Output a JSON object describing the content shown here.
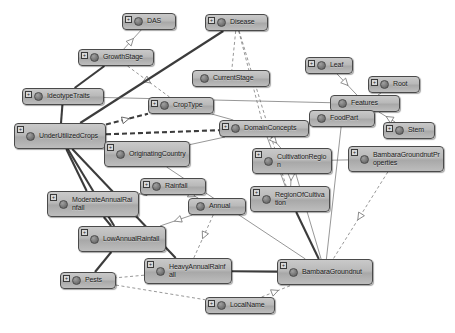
{
  "diagram": {
    "type": "ontology-class-graph",
    "background_color": "#ffffff",
    "node_fill_color": "#b9b9b9",
    "node_border_color": "#4a4a4a",
    "edge_color": "#555555",
    "canvas": {
      "width": 455,
      "height": 333
    }
  },
  "nodes": [
    {
      "id": "das",
      "label": "DAS",
      "x": 122,
      "y": 13,
      "w": 54,
      "h": 17,
      "expandable": true,
      "lines": 1
    },
    {
      "id": "disease",
      "label": "Disease",
      "x": 205,
      "y": 14,
      "w": 63,
      "h": 17,
      "expandable": true,
      "lines": 1
    },
    {
      "id": "growthstage",
      "label": "GrowthStage",
      "x": 78,
      "y": 49,
      "w": 76,
      "h": 17,
      "expandable": true,
      "lines": 1
    },
    {
      "id": "currentstage",
      "label": "CurrentStage",
      "x": 192,
      "y": 70,
      "w": 78,
      "h": 17,
      "expandable": false,
      "lines": 1
    },
    {
      "id": "leaf",
      "label": "Leaf",
      "x": 305,
      "y": 57,
      "w": 48,
      "h": 17,
      "expandable": true,
      "lines": 1
    },
    {
      "id": "root",
      "label": "Root",
      "x": 368,
      "y": 76,
      "w": 52,
      "h": 17,
      "expandable": true,
      "lines": 1
    },
    {
      "id": "features",
      "label": "Features",
      "x": 330,
      "y": 95,
      "w": 70,
      "h": 17,
      "expandable": false,
      "lines": 1
    },
    {
      "id": "foodpart",
      "label": "FoodPart",
      "x": 309,
      "y": 110,
      "w": 66,
      "h": 17,
      "expandable": false,
      "lines": 1
    },
    {
      "id": "stem",
      "label": "Stem",
      "x": 383,
      "y": 122,
      "w": 52,
      "h": 17,
      "expandable": true,
      "lines": 1
    },
    {
      "id": "ideotypetraits",
      "label": "IdeotypeTraits",
      "x": 22,
      "y": 88,
      "w": 82,
      "h": 17,
      "expandable": true,
      "lines": 1
    },
    {
      "id": "croptype",
      "label": "CropType",
      "x": 148,
      "y": 97,
      "w": 66,
      "h": 17,
      "expandable": true,
      "lines": 1
    },
    {
      "id": "domainconcepts",
      "label": "DomainConcepts",
      "x": 219,
      "y": 120,
      "w": 90,
      "h": 17,
      "expandable": true,
      "lines": 1
    },
    {
      "id": "underutilized",
      "label": "UnderUtilizedCrops",
      "x": 14,
      "y": 123,
      "w": 92,
      "h": 26,
      "expandable": true,
      "lines": 2
    },
    {
      "id": "originating",
      "label": "OriginatingCountry",
      "x": 104,
      "y": 141,
      "w": 86,
      "h": 26,
      "expandable": true,
      "lines": 2
    },
    {
      "id": "cultivationreg",
      "label": "CultivationRegion",
      "x": 252,
      "y": 148,
      "w": 80,
      "h": 26,
      "expandable": true,
      "lines": 2
    },
    {
      "id": "bgproperties",
      "label": "BambaraGroundnutProperties",
      "x": 348,
      "y": 146,
      "w": 96,
      "h": 26,
      "expandable": true,
      "lines": 2
    },
    {
      "id": "regionofcult",
      "label": "RegionOfCultivation",
      "x": 250,
      "y": 186,
      "w": 80,
      "h": 26,
      "expandable": true,
      "lines": 2
    },
    {
      "id": "rainfall",
      "label": "Rainfall",
      "x": 140,
      "y": 178,
      "w": 66,
      "h": 17,
      "expandable": true,
      "lines": 1
    },
    {
      "id": "moderaterain",
      "label": "ModerateAnnualRainfall",
      "x": 47,
      "y": 191,
      "w": 92,
      "h": 26,
      "expandable": true,
      "lines": 2
    },
    {
      "id": "annual",
      "label": "Annual",
      "x": 188,
      "y": 198,
      "w": 58,
      "h": 17,
      "expandable": false,
      "lines": 1
    },
    {
      "id": "lowrain",
      "label": "LowAnnualRainfall",
      "x": 78,
      "y": 226,
      "w": 88,
      "h": 26,
      "expandable": true,
      "lines": 2
    },
    {
      "id": "heavyrain",
      "label": "HeavyAnnualRainfall",
      "x": 144,
      "y": 258,
      "w": 88,
      "h": 26,
      "expandable": true,
      "lines": 2
    },
    {
      "id": "bambara",
      "label": "BambaraGroundnut",
      "x": 277,
      "y": 259,
      "w": 96,
      "h": 26,
      "expandable": true,
      "lines": 2
    },
    {
      "id": "pests",
      "label": "Pests",
      "x": 60,
      "y": 272,
      "w": 56,
      "h": 17,
      "expandable": true,
      "lines": 1
    },
    {
      "id": "localname",
      "label": "LocalName",
      "x": 205,
      "y": 297,
      "w": 70,
      "h": 17,
      "expandable": true,
      "lines": 1
    }
  ],
  "edges": [
    {
      "from": "growthstage",
      "to": "das",
      "style": "solid-thin",
      "arrow": "hollow-triangle"
    },
    {
      "from": "growthstage",
      "to": "croptype",
      "style": "dashed-thin",
      "arrow": "hollow-triangle"
    },
    {
      "from": "disease",
      "to": "underutilized",
      "style": "solid-thick",
      "arrow": "none"
    },
    {
      "from": "disease",
      "to": "currentstage",
      "style": "dashed-thin",
      "arrow": "none"
    },
    {
      "from": "disease",
      "to": "domainconcepts",
      "style": "dashed-thin",
      "arrow": "none"
    },
    {
      "from": "disease",
      "to": "regionofcult",
      "style": "dashed-thin",
      "arrow": "none"
    },
    {
      "from": "ideotypetraits",
      "to": "growthstage",
      "style": "solid-thick",
      "arrow": "none"
    },
    {
      "from": "ideotypetraits",
      "to": "underutilized",
      "style": "solid-thick",
      "arrow": "none"
    },
    {
      "from": "ideotypetraits",
      "to": "features",
      "style": "solid-thin",
      "arrow": "none"
    },
    {
      "from": "underutilized",
      "to": "croptype",
      "style": "dashed-thick",
      "arrow": "hollow-triangle"
    },
    {
      "from": "underutilized",
      "to": "domainconcepts",
      "style": "dashed-thick",
      "arrow": "none"
    },
    {
      "from": "underutilized",
      "to": "originating",
      "style": "solid-thick",
      "arrow": "none"
    },
    {
      "from": "underutilized",
      "to": "moderaterain",
      "style": "solid-thick",
      "arrow": "none"
    },
    {
      "from": "underutilized",
      "to": "lowrain",
      "style": "solid-thick",
      "arrow": "none"
    },
    {
      "from": "underutilized",
      "to": "heavyrain",
      "style": "solid-thick",
      "arrow": "none"
    },
    {
      "from": "leaf",
      "to": "features",
      "style": "solid-thin",
      "arrow": "hollow-triangle"
    },
    {
      "from": "root",
      "to": "features",
      "style": "solid-thin",
      "arrow": "none"
    },
    {
      "from": "stem",
      "to": "features",
      "style": "solid-thin",
      "arrow": "hollow-triangle"
    },
    {
      "from": "foodpart",
      "to": "domainconcepts",
      "style": "dashed-thick",
      "arrow": "none"
    },
    {
      "from": "foodpart",
      "to": "bambara",
      "style": "solid-thin",
      "arrow": "none"
    },
    {
      "from": "domainconcepts",
      "to": "cultivationreg",
      "style": "solid-thin",
      "arrow": "hollow-triangle"
    },
    {
      "from": "domainconcepts",
      "to": "originating",
      "style": "solid-thin",
      "arrow": "none"
    },
    {
      "from": "domainconcepts",
      "to": "regionofcult",
      "style": "solid-thin",
      "arrow": "none"
    },
    {
      "from": "cultivationreg",
      "to": "bgproperties",
      "style": "solid-thin",
      "arrow": "none"
    },
    {
      "from": "cultivationreg",
      "to": "regionofcult",
      "style": "solid-thin",
      "arrow": "hollow-triangle"
    },
    {
      "from": "cultivationreg",
      "to": "bambara",
      "style": "solid-thin",
      "arrow": "none"
    },
    {
      "from": "regionofcult",
      "to": "bambara",
      "style": "solid-thick",
      "arrow": "none"
    },
    {
      "from": "bgproperties",
      "to": "bambara",
      "style": "dashed-thin",
      "arrow": "hollow-triangle"
    },
    {
      "from": "rainfall",
      "to": "annual",
      "style": "solid-thin",
      "arrow": "hollow-triangle"
    },
    {
      "from": "rainfall",
      "to": "moderaterain",
      "style": "solid-thin",
      "arrow": "hollow-triangle"
    },
    {
      "from": "annual",
      "to": "lowrain",
      "style": "solid-thin",
      "arrow": "hollow-triangle"
    },
    {
      "from": "annual",
      "to": "heavyrain",
      "style": "dashed-thin",
      "arrow": "hollow-triangle"
    },
    {
      "from": "moderaterain",
      "to": "lowrain",
      "style": "solid-thick",
      "arrow": "none"
    },
    {
      "from": "lowrain",
      "to": "pests",
      "style": "solid-thick",
      "arrow": "none"
    },
    {
      "from": "heavyrain",
      "to": "bambara",
      "style": "solid-thick",
      "arrow": "none"
    },
    {
      "from": "heavyrain",
      "to": "pests",
      "style": "dashed-thin",
      "arrow": "none"
    },
    {
      "from": "pests",
      "to": "localname",
      "style": "dashed-thin",
      "arrow": "none"
    },
    {
      "from": "localname",
      "to": "bambara",
      "style": "dashed-thin",
      "arrow": "hollow-triangle"
    },
    {
      "from": "originating",
      "to": "bambara",
      "style": "solid-thin",
      "arrow": "none"
    },
    {
      "from": "croptype",
      "to": "domainconcepts",
      "style": "solid-thin",
      "arrow": "none"
    }
  ]
}
